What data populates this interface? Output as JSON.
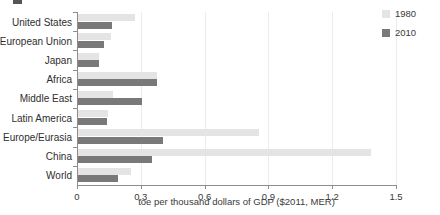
{
  "chart_data": {
    "type": "bar",
    "orientation": "horizontal",
    "title": "",
    "xlabel": "toe per thousand dollars of GDP ($2011, MER)",
    "ylabel": "",
    "xlim": [
      0,
      1.5
    ],
    "xticks": [
      "0",
      "0.3",
      "0.6",
      "0.9",
      "1.2",
      "1.5"
    ],
    "xtick_values": [
      0,
      0.3,
      0.6,
      0.9,
      1.2,
      1.5
    ],
    "grid": true,
    "grid_axis": "x",
    "legend_position": "top-right",
    "categories": [
      "United States",
      "European Union",
      "Japan",
      "Africa",
      "Middle East",
      "Latin America",
      "E. Europe/Eurasia",
      "China",
      "World"
    ],
    "series": [
      {
        "name": "1980",
        "color": "#e4e4e4",
        "values": [
          0.27,
          0.155,
          0.1,
          0.37,
          0.165,
          0.14,
          0.85,
          1.38,
          0.25
        ]
      },
      {
        "name": "2010",
        "color": "#797979",
        "values": [
          0.16,
          0.12,
          0.1,
          0.37,
          0.3,
          0.135,
          0.4,
          0.35,
          0.19
        ]
      }
    ]
  },
  "legend": {
    "items": [
      {
        "label": "1980",
        "color": "#e4e4e4"
      },
      {
        "label": "2010",
        "color": "#797979"
      }
    ]
  }
}
